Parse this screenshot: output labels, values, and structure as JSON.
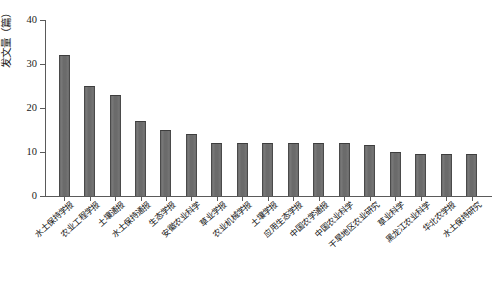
{
  "chart_data": {
    "type": "bar",
    "title": "",
    "xlabel": "",
    "ylabel": "发文量（篇）",
    "ylim": [
      0,
      40
    ],
    "yticks": [
      0,
      10,
      20,
      30,
      40
    ],
    "grid": false,
    "legend": null,
    "bar_color": "#6f6f6f",
    "bar_edge_color": "#4a4a4a",
    "axis_color": "#5a5a5a",
    "categories": [
      "水土保持学报",
      "农业工程学报",
      "土壤通报",
      "水土保持通报",
      "生态学报",
      "安徽农业科学",
      "草业学报",
      "农业机械学报",
      "土壤学报",
      "应用生态学报",
      "中国农学通报",
      "中国农业科学",
      "干旱地区农业研究",
      "草业科学",
      "黑龙江农业科学",
      "华北农学报",
      "水土保持研究"
    ],
    "values": [
      32,
      25,
      23,
      17,
      15,
      14,
      12,
      12,
      12,
      12,
      12,
      12,
      11.5,
      10,
      9.5,
      9.5,
      9.5
    ]
  },
  "axis": {
    "y_tick_labels": [
      "0",
      "10",
      "20",
      "30",
      "40"
    ]
  }
}
